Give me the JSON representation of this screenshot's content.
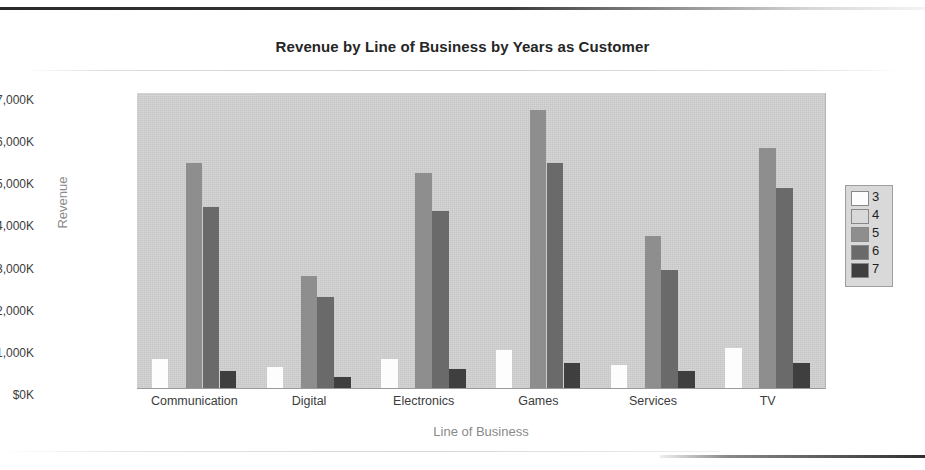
{
  "chart_data": {
    "type": "bar",
    "title": "Revenue by Line of Business by Years as Customer",
    "xlabel": "Line of Business",
    "ylabel": "Revenue",
    "categories": [
      "Communication",
      "Digital",
      "Electronics",
      "Games",
      "Services",
      "TV"
    ],
    "ylim": [
      0,
      7000
    ],
    "ytick_labels": [
      "$7,000K",
      "$6,000K",
      "$5,000K",
      "$4,000K",
      "$3,000K",
      "$2,000K",
      "$1,000K",
      "$0K"
    ],
    "ytick_values": [
      7000,
      6000,
      5000,
      4000,
      3000,
      2000,
      1000,
      0
    ],
    "grid": false,
    "legend_position": "right",
    "legend_title": "",
    "series": [
      {
        "name": "3",
        "color": "#fdfdfd",
        "values": [
          700,
          500,
          700,
          900,
          550,
          950
        ]
      },
      {
        "name": "4",
        "color": "#d2d2d2",
        "values": [
          0,
          0,
          0,
          0,
          0,
          0
        ]
      },
      {
        "name": "5",
        "color": "#8e8e8e",
        "values": [
          5350,
          2650,
          5100,
          6600,
          3600,
          5700
        ]
      },
      {
        "name": "6",
        "color": "#6a6a6a",
        "values": [
          4300,
          2150,
          4200,
          5350,
          2800,
          4750
        ]
      },
      {
        "name": "7",
        "color": "#3f3f3f",
        "values": [
          400,
          250,
          450,
          600,
          400,
          600
        ]
      }
    ]
  },
  "legend": {
    "entries": [
      {
        "label": "3",
        "color": "#fdfdfd"
      },
      {
        "label": "4",
        "color": "#d9d9d9"
      },
      {
        "label": "5",
        "color": "#8e8e8e"
      },
      {
        "label": "6",
        "color": "#6a6a6a"
      },
      {
        "label": "7",
        "color": "#3f3f3f"
      }
    ]
  },
  "plot": {
    "background_color": "#d2d2d2",
    "axis_label_color": "#8a8a8a",
    "title_color": "#262626"
  }
}
